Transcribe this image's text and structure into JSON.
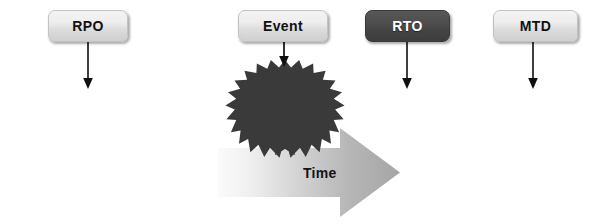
{
  "diagram": {
    "canvas": {
      "width": 594,
      "height": 224,
      "background": "#ffffff"
    },
    "labels": [
      {
        "key": "rpo",
        "text": "RPO",
        "style": "light",
        "x": 48,
        "y": 10,
        "w": 80,
        "h": 32,
        "arrow_x": 88,
        "arrow_from": 42,
        "arrow_to": 88
      },
      {
        "key": "event",
        "text": "Event",
        "style": "light",
        "x": 238,
        "y": 10,
        "w": 90,
        "h": 32,
        "arrow_x": 284,
        "arrow_from": 42,
        "arrow_to": 66
      },
      {
        "key": "rto",
        "text": "RTO",
        "style": "dark",
        "x": 365,
        "y": 10,
        "w": 85,
        "h": 32,
        "arrow_x": 407,
        "arrow_from": 42,
        "arrow_to": 88
      },
      {
        "key": "mtd",
        "text": "MTD",
        "style": "light",
        "x": 493,
        "y": 10,
        "w": 85,
        "h": 32,
        "arrow_x": 533,
        "arrow_from": 42,
        "arrow_to": 88
      }
    ],
    "timeline": {
      "name": "horizontal-timeline",
      "y": 101,
      "x_start": 14,
      "x_end": 582,
      "color": "#111111",
      "thickness": 1.6
    },
    "burst": {
      "name": "event-starburst",
      "center_x": 285,
      "center_y": 101,
      "outer_rx": 53,
      "outer_ry": 45,
      "inner_rx": 40,
      "inner_ry": 33,
      "points": 22,
      "color": "#3a3a3a"
    },
    "time_arrow": {
      "label": "Time",
      "x_start": 218,
      "x_tip": 400,
      "shaft_top": 148,
      "shaft_bottom": 197,
      "head_start": 340,
      "head_top": 128,
      "head_bottom": 217,
      "label_x": 303,
      "label_y": 165,
      "gradient_from": "#f7f7f7",
      "gradient_to": "#a8a8a8"
    },
    "colors": {
      "dark_box": "#474747",
      "light_box": "#e4e4e4",
      "line": "#111111",
      "burst": "#3a3a3a",
      "arrow_gradient_light": "#f7f7f7",
      "arrow_gradient_dark": "#a8a8a8"
    }
  }
}
